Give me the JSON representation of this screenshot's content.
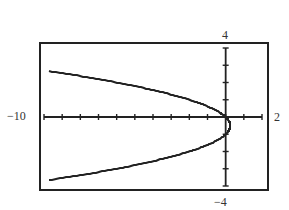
{
  "chart_data": {
    "type": "line",
    "title": "",
    "xlabel": "",
    "ylabel": "",
    "xlim": [
      -10,
      2
    ],
    "ylim": [
      -4,
      4
    ],
    "grid": false,
    "x_tick_step": 1,
    "y_tick_step": 1,
    "window_labels": {
      "xmin": "−10",
      "xmax": "2",
      "ymin": "−4",
      "ymax": "4"
    },
    "series": [
      {
        "name": "parabola opening left (x = -y² - y)",
        "equation": "y^2 + y + x = 0",
        "points": [
          {
            "x": -9.75,
            "y": 2.66
          },
          {
            "x": -6,
            "y": 1.95
          },
          {
            "x": -2,
            "y": 1.0
          },
          {
            "x": 0,
            "y": 0
          },
          {
            "x": 0.25,
            "y": -0.5
          },
          {
            "x": 0,
            "y": -1
          },
          {
            "x": -2,
            "y": -2.0
          },
          {
            "x": -6,
            "y": -2.95
          },
          {
            "x": -9.75,
            "y": -3.66
          }
        ]
      }
    ]
  }
}
